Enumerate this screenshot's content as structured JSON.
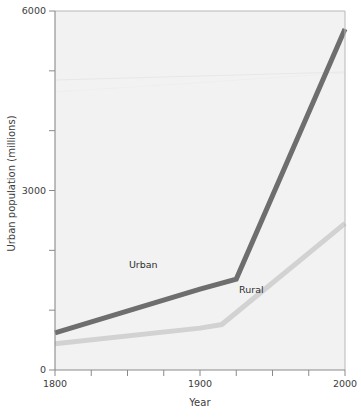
{
  "chart_data": {
    "type": "line",
    "title": "",
    "xlabel": "Year",
    "ylabel": "Urban population (millions)",
    "xlim": [
      1800,
      2000
    ],
    "ylim": [
      0,
      6000
    ],
    "grid": false,
    "legend_position": "inline-annotations",
    "x_ticks": [
      1800,
      1825,
      1850,
      1875,
      1900,
      1925,
      1950,
      1975,
      2000
    ],
    "x_tick_labels": [
      "1800",
      "",
      "",
      "",
      "1900",
      "",
      "",
      "",
      "2000"
    ],
    "y_ticks": [
      0,
      1000,
      2000,
      3000,
      4000,
      5000,
      6000
    ],
    "y_tick_labels": [
      "0",
      "",
      "",
      "3000",
      "",
      "",
      "6000"
    ],
    "series": [
      {
        "name": "Urban",
        "color": "#6e6e6e",
        "x": [
          1800,
          1900,
          1925,
          2000
        ],
        "values": [
          620,
          1350,
          1520,
          5700
        ]
      },
      {
        "name": "Rural",
        "color": "#d2d2d2",
        "x": [
          1800,
          1900,
          1915,
          2000
        ],
        "values": [
          440,
          700,
          760,
          2450
        ]
      }
    ],
    "annotations": [
      {
        "text": "Urban",
        "x": 1862,
        "y": 1760
      },
      {
        "text": "Rural",
        "x": 1938,
        "y": 1330
      }
    ]
  },
  "axis_labels": {
    "y_title": "Urban population (millions)",
    "x_title": "Year"
  },
  "colors": {
    "urban": "#6e6e6e",
    "rural": "#d2d2d2",
    "axis": "#8a8a8a",
    "text": "#3d3d3d",
    "plot_background": "#f2f2f2"
  }
}
